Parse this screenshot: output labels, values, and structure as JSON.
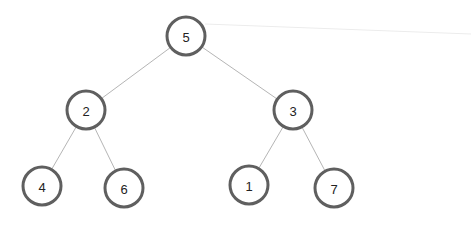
{
  "diagram": {
    "type": "binary-tree",
    "colors": {
      "node_stroke": "#5f5f5f",
      "node_fill": "#ffffff",
      "edge": "#b5b5b5",
      "text": "#222222"
    },
    "node_radius": 19,
    "nodes": [
      {
        "id": "n5",
        "label": "5",
        "x": 186,
        "y": 36
      },
      {
        "id": "n2",
        "label": "2",
        "x": 86,
        "y": 110
      },
      {
        "id": "n3",
        "label": "3",
        "x": 293,
        "y": 110
      },
      {
        "id": "n4",
        "label": "4",
        "x": 42,
        "y": 186
      },
      {
        "id": "n6",
        "label": "6",
        "x": 124,
        "y": 188
      },
      {
        "id": "n1",
        "label": "1",
        "x": 249,
        "y": 185
      },
      {
        "id": "n7",
        "label": "7",
        "x": 334,
        "y": 188
      }
    ],
    "edges": [
      {
        "from": "n5",
        "to": "n2"
      },
      {
        "from": "n5",
        "to": "n3"
      },
      {
        "from": "n2",
        "to": "n4"
      },
      {
        "from": "n2",
        "to": "n6"
      },
      {
        "from": "n3",
        "to": "n1"
      },
      {
        "from": "n3",
        "to": "n7"
      }
    ],
    "faint_line": {
      "x1": 205,
      "y1": 24,
      "x2": 471,
      "y2": 34
    }
  }
}
